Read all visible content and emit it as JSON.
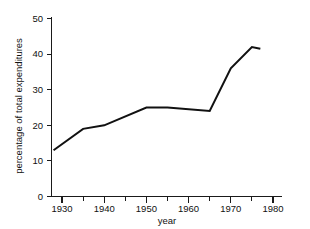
{
  "chart_data": {
    "type": "line",
    "title": "",
    "xlabel": "year",
    "ylabel": "percentage of total expenditures",
    "xlim": [
      1928,
      1981
    ],
    "ylim": [
      0,
      50
    ],
    "grid": false,
    "legend": null,
    "x_ticks": [
      1930,
      1940,
      1950,
      1960,
      1970,
      1980
    ],
    "x_tick_labels": [
      "1930",
      "1940",
      "1950",
      "1960",
      "1970",
      "1980"
    ],
    "x_minor_ticks": [
      1935,
      1945,
      1955,
      1965,
      1975
    ],
    "y_ticks": [
      0,
      10,
      20,
      30,
      40,
      50
    ],
    "y_tick_labels": [
      "0",
      "10",
      "20",
      "30",
      "40",
      "50"
    ],
    "series": [
      {
        "name": "percentage of total expenditures",
        "color": "#111111",
        "x": [
          1928,
          1935,
          1940,
          1950,
          1955,
          1965,
          1970,
          1975,
          1977
        ],
        "values": [
          13,
          19,
          20,
          25,
          25,
          24,
          36,
          42,
          41.5
        ]
      }
    ]
  },
  "axes": {
    "y_title": "percentage of total expenditures",
    "x_title": "year",
    "y_labels": [
      "50",
      "40",
      "30",
      "20",
      "10",
      "0"
    ],
    "x_labels": [
      "1930",
      "1940",
      "1950",
      "1960",
      "1970",
      "1980"
    ]
  },
  "colors": {
    "line": "#111111",
    "axis": "#1a1a1a",
    "background": "#ffffff"
  }
}
